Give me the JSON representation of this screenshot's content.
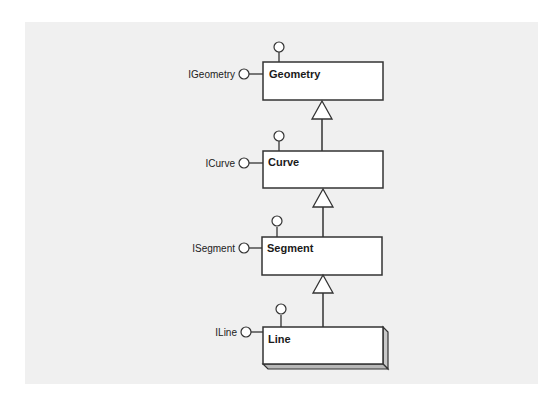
{
  "diagram": {
    "type": "UML class hierarchy with interface lollipops",
    "classes": [
      {
        "name": "Geometry",
        "interface": "IGeometry",
        "style": "plain"
      },
      {
        "name": "Curve",
        "interface": "ICurve",
        "style": "plain"
      },
      {
        "name": "Segment",
        "interface": "ISegment",
        "style": "plain"
      },
      {
        "name": "Line",
        "interface": "ILine",
        "style": "3d-beveled"
      }
    ],
    "relationships": [
      {
        "from": "Curve",
        "to": "Geometry",
        "kind": "inheritance"
      },
      {
        "from": "Segment",
        "to": "Curve",
        "kind": "inheritance"
      },
      {
        "from": "Line",
        "to": "Segment",
        "kind": "inheritance"
      }
    ],
    "colors": {
      "background": "#ffffff",
      "panel": "#f0f0f0",
      "stroke": "#333333",
      "box_fill": "#ffffff",
      "bevel_fill": "#c8c8c8"
    }
  }
}
